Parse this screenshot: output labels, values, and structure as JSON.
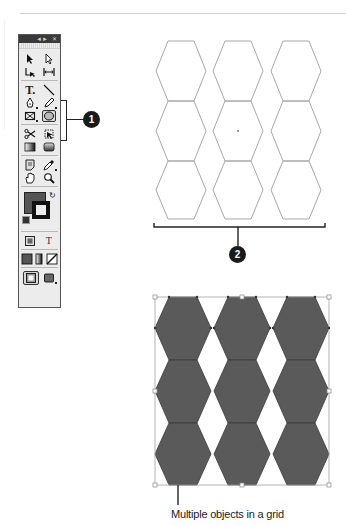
{
  "tools_panel": {
    "titlebar": {
      "collapse_icon": "double-arrow-icon",
      "close_icon": "close-icon"
    },
    "tools": [
      {
        "name": "selection-tool",
        "icon": "black-arrow-icon"
      },
      {
        "name": "direct-selection-tool",
        "icon": "white-arrow-icon"
      },
      {
        "name": "page-tool",
        "icon": "page-icon"
      },
      {
        "name": "gap-tool",
        "icon": "gap-icon"
      },
      {
        "name": "type-tool",
        "icon": "type-icon",
        "glyph": "T."
      },
      {
        "name": "line-tool",
        "icon": "line-icon"
      },
      {
        "name": "pen-tool",
        "icon": "pen-icon"
      },
      {
        "name": "pencil-tool",
        "icon": "pencil-icon"
      },
      {
        "name": "rectangle-frame-tool",
        "icon": "rectangle-frame-icon"
      },
      {
        "name": "polygon-tool",
        "icon": "polygon-icon",
        "selected": true
      },
      {
        "name": "scissors-tool",
        "icon": "scissors-icon"
      },
      {
        "name": "free-transform-tool",
        "icon": "free-transform-icon"
      },
      {
        "name": "gradient-swatch-tool",
        "icon": "gradient-swatch-icon"
      },
      {
        "name": "gradient-feather-tool",
        "icon": "gradient-feather-icon"
      },
      {
        "name": "note-tool",
        "icon": "note-icon"
      },
      {
        "name": "eyedropper-tool",
        "icon": "eyedropper-icon"
      },
      {
        "name": "hand-tool",
        "icon": "hand-icon"
      },
      {
        "name": "zoom-tool",
        "icon": "zoom-icon"
      },
      {
        "name": "formatting-container",
        "icon": "container-icon"
      },
      {
        "name": "formatting-text",
        "icon": "text-format-icon",
        "glyph": "T"
      },
      {
        "name": "apply-color",
        "icon": "apply-color-icon"
      },
      {
        "name": "apply-gradient",
        "icon": "apply-gradient-icon"
      },
      {
        "name": "apply-none",
        "icon": "apply-none-icon"
      },
      {
        "name": "normal-view",
        "icon": "normal-view-icon"
      },
      {
        "name": "preview-view",
        "icon": "preview-view-icon"
      }
    ],
    "fill_color": "#555555",
    "stroke_color": "#111111"
  },
  "callouts": [
    {
      "number": "1",
      "target": "polygon-tool-group"
    },
    {
      "number": "2",
      "target": "hexagon-grid-outline"
    }
  ],
  "top_grid": {
    "rows": 3,
    "cols": 3,
    "stroke": "#a8a8a8",
    "fill": "none"
  },
  "bottom_grid": {
    "rows": 3,
    "cols": 3,
    "fill": "#5a5a5a",
    "stroke": "#3a3a3a",
    "selection_color": "#a0a0a0"
  },
  "caption": "Multiple objects in a grid"
}
